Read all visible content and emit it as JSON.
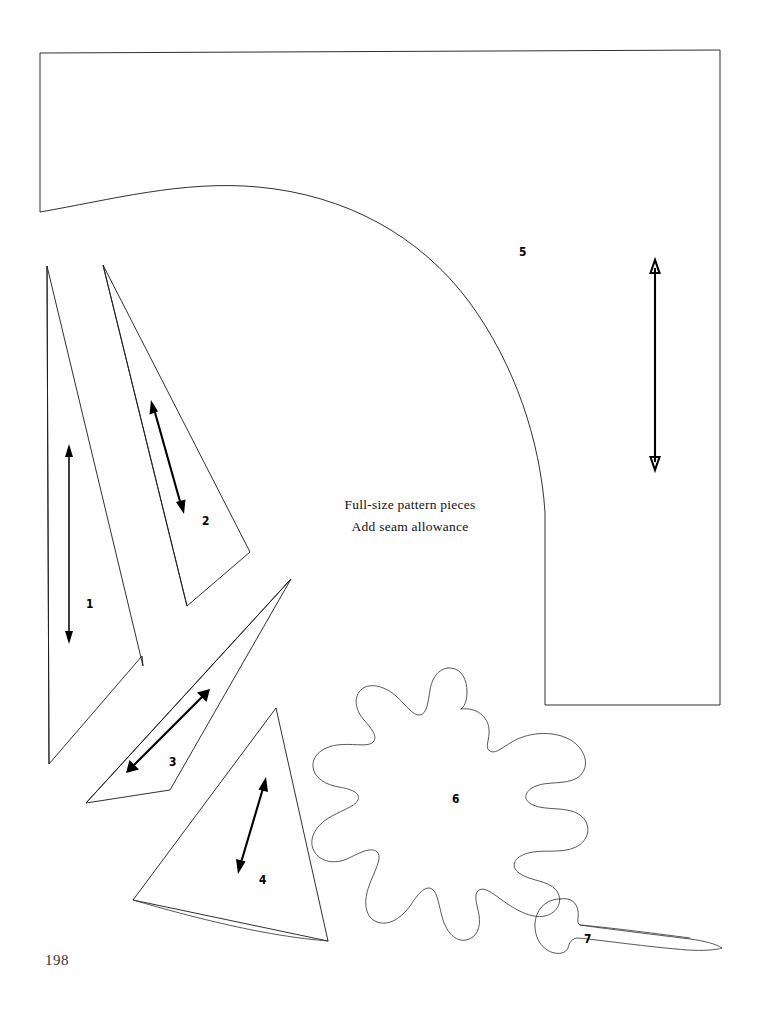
{
  "page": {
    "page_number": "198",
    "background_color": "#ffffff",
    "ink_color": "#1a1a1a",
    "width": 761,
    "height": 1017
  },
  "caption": {
    "line1": "Full-size pattern pieces",
    "line2": "Add seam allowance"
  },
  "pattern": {
    "title": "Full-size pattern pieces",
    "piece_count": 7,
    "pieces": [
      {
        "id": "piece-1",
        "label": "1",
        "shape": "narrow-triangle-with-notch",
        "label_x": 86,
        "label_y": 597,
        "grainline": {
          "x1": 69,
          "y1": 447,
          "x2": 69,
          "y2": 641,
          "double_headed": true
        }
      },
      {
        "id": "piece-2",
        "label": "2",
        "shape": "narrow-triangle",
        "label_x": 202,
        "label_y": 514,
        "grainline": {
          "x1": 151,
          "y1": 401,
          "x2": 184,
          "y2": 513,
          "double_headed": true
        }
      },
      {
        "id": "piece-3",
        "label": "3",
        "shape": "slender-triangle-diagonal",
        "label_x": 169,
        "label_y": 755,
        "grainline": {
          "x1": 209,
          "y1": 690,
          "x2": 126,
          "y2": 773,
          "double_headed": true
        }
      },
      {
        "id": "piece-4",
        "label": "4",
        "shape": "triangle-curved-base",
        "label_x": 259,
        "label_y": 873,
        "grainline": {
          "x1": 266,
          "y1": 778,
          "x2": 238,
          "y2": 873,
          "double_headed": true
        }
      },
      {
        "id": "piece-5",
        "label": "5",
        "shape": "rectangle-with-quarter-circle-cutout",
        "label_x": 519,
        "label_y": 245,
        "grainline": {
          "x1": 655,
          "y1": 262,
          "x2": 655,
          "y2": 468,
          "double_headed": true
        }
      },
      {
        "id": "piece-6",
        "label": "6",
        "shape": "lobed-leaf-blob",
        "label_x": 452,
        "label_y": 792,
        "grainline": null
      },
      {
        "id": "piece-7",
        "label": "7",
        "shape": "tapered-curved-trunk",
        "label_x": 584,
        "label_y": 932,
        "grainline": null
      }
    ]
  }
}
